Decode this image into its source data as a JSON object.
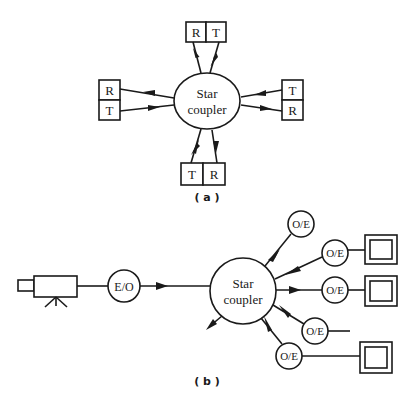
{
  "figure_a": {
    "caption": "( a )",
    "coupler": {
      "label_line1": "Star",
      "label_line2": "coupler"
    },
    "nodes": {
      "top": {
        "first": "R",
        "second": "T"
      },
      "left": {
        "first": "R",
        "second": "T"
      },
      "right": {
        "first": "T",
        "second": "R"
      },
      "bottom": {
        "first": "T",
        "second": "R"
      }
    }
  },
  "figure_b": {
    "caption": "( b )",
    "source": {
      "icon": "video-camera-icon"
    },
    "transmitter": {
      "label": "E/O"
    },
    "coupler": {
      "label_line1": "Star",
      "label_line2": "coupler"
    },
    "receivers": [
      {
        "label": "O/E",
        "output": "none"
      },
      {
        "label": "O/E",
        "output": "monitor"
      },
      {
        "label": "O/E",
        "output": "monitor"
      },
      {
        "label": "O/E",
        "output": "line"
      },
      {
        "label": "O/E",
        "output": "monitor"
      }
    ]
  },
  "colors": {
    "ink": "#1a1a1a",
    "background": "#ffffff"
  }
}
